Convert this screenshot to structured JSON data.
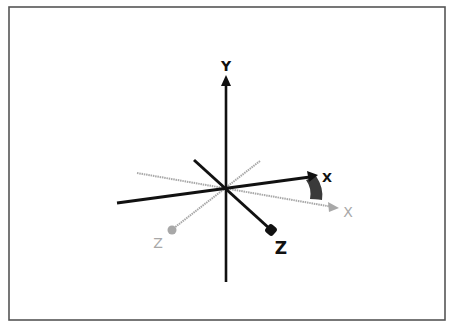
{
  "diagram": {
    "title": "",
    "colors": {
      "background": "#ffffff",
      "border": "#555555",
      "rotated_axes": "#111111",
      "original_axes": "#a8a8a8",
      "rotation_wedge": "#333333"
    },
    "axes": {
      "y": {
        "label": "Y",
        "color": "#111111"
      },
      "x_rotated": {
        "label": "X",
        "color": "#111111"
      },
      "z_rotated": {
        "label": "Z",
        "color": "#111111"
      },
      "x_original": {
        "label": "X",
        "color": "#a8a8a8"
      },
      "z_original": {
        "label": "Z",
        "color": "#a8a8a8"
      }
    }
  }
}
